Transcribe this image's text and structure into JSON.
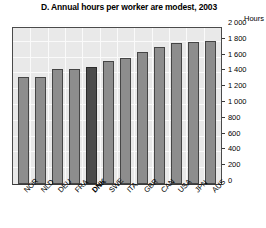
{
  "chart_data": {
    "type": "bar",
    "title": "D. Annual hours per worker are modest, 2003",
    "xlabel": "",
    "ylabel": "Hours",
    "ylim": [
      0,
      2000
    ],
    "yticks": [
      "0",
      "200",
      "400",
      "600",
      "800",
      "1 000",
      "1 200",
      "1 400",
      "1 600",
      "1 800",
      "2 000"
    ],
    "ytick_values": [
      0,
      200,
      400,
      600,
      800,
      1000,
      1200,
      1400,
      1600,
      1800,
      2000
    ],
    "grid": true,
    "legend": "none",
    "categories": [
      "NOR",
      "NLD",
      "DEU",
      "FRA",
      "DNK",
      "SWE",
      "ITA",
      "GBR",
      "CAN",
      "USA",
      "JPN",
      "AUS"
    ],
    "values": [
      1350,
      1355,
      1450,
      1450,
      1475,
      1560,
      1590,
      1670,
      1730,
      1790,
      1800,
      1810
    ],
    "highlight_category": "DNK",
    "bar_color": "#8d8d8d",
    "highlight_color": "#4b4b4b",
    "plot_background": "#e9e9e9",
    "gridline_color": "#fafafa",
    "axis_color": "#3a3a3a"
  }
}
